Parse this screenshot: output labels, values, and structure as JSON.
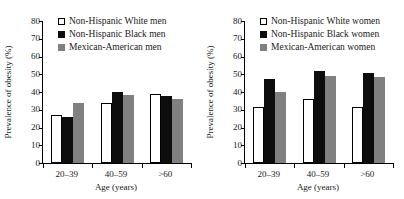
{
  "figure": {
    "panels": [
      {
        "id": "men",
        "ylabel": "Prevalence of obesity (%)",
        "xlabel": "Age (years)",
        "yticks": [
          "0",
          "10",
          "20",
          "30",
          "40",
          "50",
          "60",
          "70",
          "80"
        ],
        "xticklabels": [
          "20–39",
          "40–59",
          ">60"
        ],
        "legend": [
          {
            "label": "Non-Hispanic White men",
            "style": "white"
          },
          {
            "label": "Non-Hispanic Black men",
            "style": "black"
          },
          {
            "label": "Mexican-American men",
            "style": "gray"
          }
        ]
      },
      {
        "id": "women",
        "ylabel": "Prevalence of obesity (%)",
        "xlabel": "Age (years)",
        "yticks": [
          "0",
          "10",
          "20",
          "30",
          "40",
          "50",
          "60",
          "70",
          "80"
        ],
        "xticklabels": [
          "20–39",
          "40–59",
          ">60"
        ],
        "legend": [
          {
            "label": "Non-Hispanic White women",
            "style": "white"
          },
          {
            "label": "Non-Hispanic Black women",
            "style": "black"
          },
          {
            "label": "Mexican-American women",
            "style": "gray"
          }
        ]
      }
    ]
  },
  "colors": {
    "white_bar_fill": "#ffffff",
    "white_bar_edge": "#000000",
    "black_bar": "#0d0d0d",
    "gray_bar": "#808080",
    "axis": "#000000",
    "text": "#1a1a1a",
    "background": "#ffffff"
  },
  "chart_data": [
    {
      "type": "bar",
      "title": "",
      "panel": "men",
      "xlabel": "Age (years)",
      "ylabel": "Prevalence of obesity (%)",
      "categories": [
        "20–39",
        "40–59",
        ">60"
      ],
      "ylim": [
        0,
        80
      ],
      "ytick_step": 10,
      "grid": false,
      "legend_position": "top-left",
      "series": [
        {
          "name": "Non-Hispanic White men",
          "style": "white",
          "values": [
            27,
            34,
            39
          ]
        },
        {
          "name": "Non-Hispanic Black men",
          "style": "black",
          "values": [
            26,
            40,
            38
          ]
        },
        {
          "name": "Mexican-American men",
          "style": "gray",
          "values": [
            34,
            38.5,
            36
          ]
        }
      ]
    },
    {
      "type": "bar",
      "title": "",
      "panel": "women",
      "xlabel": "Age (years)",
      "ylabel": "Prevalence of obesity (%)",
      "categories": [
        "20–39",
        "40–59",
        ">60"
      ],
      "ylim": [
        0,
        80
      ],
      "ytick_step": 10,
      "grid": false,
      "legend_position": "top-left",
      "series": [
        {
          "name": "Non-Hispanic White women",
          "style": "white",
          "values": [
            31.5,
            36,
            31.5
          ]
        },
        {
          "name": "Non-Hispanic Black women",
          "style": "black",
          "values": [
            47.5,
            52,
            50.5
          ]
        },
        {
          "name": "Mexican-American women",
          "style": "gray",
          "values": [
            40,
            49,
            48.5
          ]
        }
      ]
    }
  ]
}
